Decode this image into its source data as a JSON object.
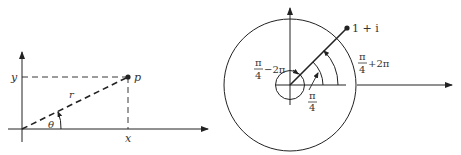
{
  "left_diagram": {
    "title": "Polar coordinates of a point",
    "labels": {
      "y": "y",
      "x": "x",
      "point": "p",
      "radius": "r",
      "angle": "θ"
    }
  },
  "right_diagram": {
    "title": "Multiple arguments of 1 + i",
    "labels": {
      "point": "1 + i",
      "arg_minus_num": "π",
      "arg_minus_den": "4",
      "arg_minus_suffix": "−2π",
      "arg_main_num": "π",
      "arg_main_den": "4",
      "arg_plus_num": "π",
      "arg_plus_den": "4",
      "arg_plus_suffix": "+2π"
    }
  },
  "colors": {
    "ink": "#222222",
    "background": "#ffffff"
  }
}
